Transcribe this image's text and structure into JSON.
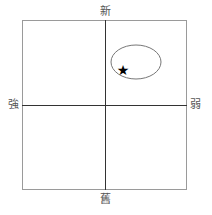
{
  "diagram": {
    "type": "quadrant",
    "axes": {
      "top": "新",
      "bottom": "舊",
      "left": "強",
      "right": "弱"
    },
    "ellipse": {
      "cx": 136,
      "cy": 62,
      "rx": 25,
      "ry": 17,
      "stroke": "#777777"
    },
    "star": {
      "x": 123,
      "y": 70,
      "glyph": "★",
      "color": "#000000"
    }
  }
}
